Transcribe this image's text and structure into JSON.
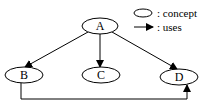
{
  "diagram": {
    "nodes": [
      {
        "id": "A",
        "label": "A"
      },
      {
        "id": "B",
        "label": "B"
      },
      {
        "id": "C",
        "label": "C"
      },
      {
        "id": "D",
        "label": "D"
      }
    ],
    "edges": [
      {
        "from": "A",
        "to": "B",
        "relation": "uses"
      },
      {
        "from": "A",
        "to": "C",
        "relation": "uses"
      },
      {
        "from": "A",
        "to": "D",
        "relation": "uses"
      },
      {
        "from": "B",
        "to": "D",
        "relation": "uses"
      }
    ]
  },
  "legend": {
    "concept_label": ": concept",
    "uses_label": ": uses"
  },
  "colors": {
    "stroke": "#000000",
    "background": "#ffffff"
  }
}
